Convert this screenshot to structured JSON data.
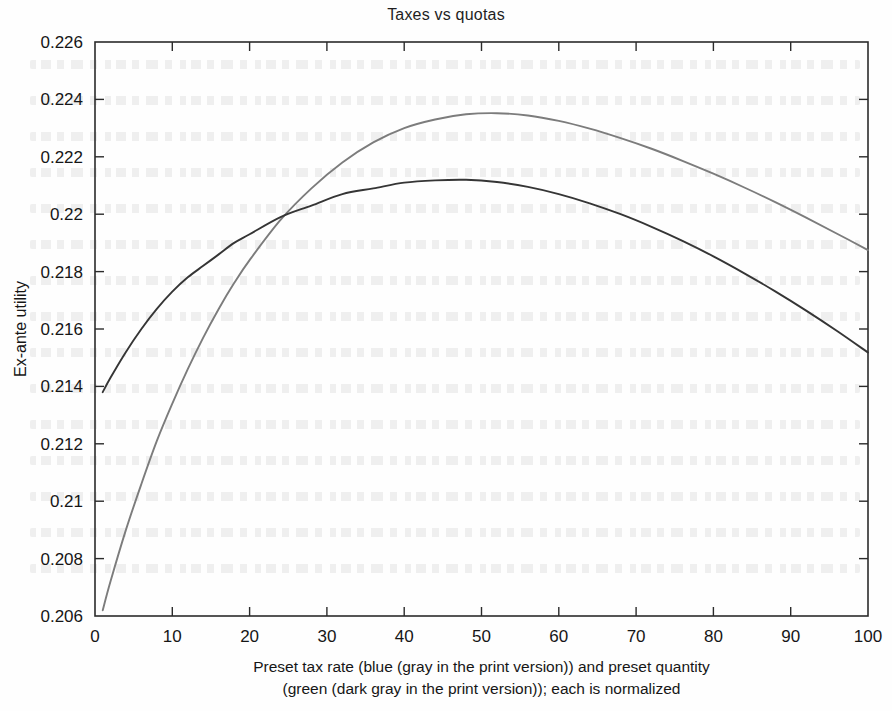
{
  "chart_data": {
    "type": "line",
    "title": "Taxes vs quotas",
    "xlabel": "Preset tax rate (blue (gray in the print version)) and preset quantity (green (dark gray in the print version)); each is normalized",
    "xlabel_lines": [
      "Preset tax rate (blue (gray in the print version)) and preset quantity",
      "(green (dark gray in the print version)); each is normalized"
    ],
    "ylabel": "Ex-ante utility",
    "xlim": [
      0,
      100
    ],
    "ylim": [
      0.206,
      0.226
    ],
    "xticks": [
      0,
      10,
      20,
      30,
      40,
      50,
      60,
      70,
      80,
      90,
      100
    ],
    "xtick_labels": [
      "0",
      "10",
      "20",
      "30",
      "40",
      "50",
      "60",
      "70",
      "80",
      "90",
      "100"
    ],
    "yticks": [
      0.206,
      0.208,
      0.21,
      0.212,
      0.214,
      0.216,
      0.218,
      0.22,
      0.222,
      0.224,
      0.226
    ],
    "ytick_labels": [
      "0.206",
      "0.208",
      "0.21",
      "0.212",
      "0.214",
      "0.216",
      "0.218",
      "0.22",
      "0.222",
      "0.224",
      "0.226"
    ],
    "grid": false,
    "legend": "none",
    "series": [
      {
        "name": "Preset tax rate (blue / gray in print version)",
        "color": "#7c7c7c",
        "x": [
          1,
          2,
          4,
          6,
          8,
          10,
          12,
          14,
          16,
          18,
          20,
          24,
          28,
          32,
          36,
          40,
          44,
          48,
          52,
          56,
          60,
          64,
          68,
          72,
          76,
          80,
          84,
          88,
          92,
          96,
          100
        ],
        "y": [
          0.2062,
          0.2072,
          0.209,
          0.2106,
          0.2121,
          0.2134,
          0.2146,
          0.2157,
          0.2167,
          0.2176,
          0.2184,
          0.2198,
          0.2209,
          0.2218,
          0.2225,
          0.223,
          0.2233,
          0.22348,
          0.22352,
          0.22344,
          0.22325,
          0.22298,
          0.22265,
          0.22228,
          0.22186,
          0.22141,
          0.22093,
          0.22042,
          0.21988,
          0.21932,
          0.21875
        ]
      },
      {
        "name": "Preset quantity (green / dark gray in print version)",
        "color": "#353535",
        "x": [
          1,
          2,
          4,
          6,
          8,
          10,
          12,
          14,
          16,
          18,
          20,
          24,
          28,
          32,
          36,
          40,
          44,
          48,
          52,
          56,
          60,
          64,
          68,
          72,
          76,
          80,
          84,
          88,
          92,
          96,
          100
        ],
        "y": [
          0.2138,
          0.2143,
          0.2152,
          0.216,
          0.2167,
          0.2173,
          0.2178,
          0.2182,
          0.2186,
          0.219,
          0.2193,
          0.2199,
          0.2203,
          0.2207,
          0.2209,
          0.2211,
          0.22118,
          0.2212,
          0.22112,
          0.22095,
          0.2207,
          0.22038,
          0.22,
          0.21956,
          0.21907,
          0.21853,
          0.21794,
          0.21731,
          0.21664,
          0.21593,
          0.21518
        ]
      }
    ],
    "annotations": {
      "crossing_point_approx": {
        "x": 15,
        "y": 0.218
      }
    }
  }
}
